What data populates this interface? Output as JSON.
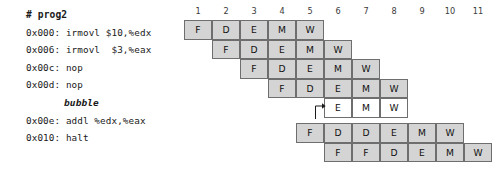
{
  "program": {
    "title": "# prog2",
    "lines": [
      {
        "text": "# prog2",
        "style": "title"
      },
      {
        "text": "0x000: irmovl $10,%edx",
        "style": "code"
      },
      {
        "text": "0x006: irmovl  $3,%eax",
        "style": "code"
      },
      {
        "text": "0x00c: nop",
        "style": "code"
      },
      {
        "text": "0x00d: nop",
        "style": "code"
      },
      {
        "text": "bubble",
        "style": "bubble"
      },
      {
        "text": "0x00e: addl %edx,%eax",
        "style": "code"
      },
      {
        "text": "0x010: halt",
        "style": "code"
      }
    ]
  },
  "chart_data": {
    "type": "table",
    "title": "# prog2",
    "xlabel": "cycle",
    "ylabel": "instruction",
    "cycles": [
      1,
      2,
      3,
      4,
      5,
      6,
      7,
      8,
      9,
      10,
      11
    ],
    "column_count": 11,
    "row_count": 7,
    "stage_names": {
      "F": "Fetch",
      "D": "Decode",
      "E": "Execute",
      "M": "Memory",
      "W": "Write back"
    },
    "colors": {
      "cell_fill": "#d4d4d4",
      "bubble_fill": "#ffffff",
      "cell_border": "#6e6e6e",
      "text": "#111111",
      "header_text": "#3a3a3a"
    },
    "rows": [
      {
        "instruction": "0x000: irmovl $10,%edx",
        "start_cycle": 1,
        "bubble": false,
        "stages": [
          "F",
          "D",
          "E",
          "M",
          "W"
        ]
      },
      {
        "instruction": "0x006: irmovl  $3,%eax",
        "start_cycle": 2,
        "bubble": false,
        "stages": [
          "F",
          "D",
          "E",
          "M",
          "W"
        ]
      },
      {
        "instruction": "0x00c: nop",
        "start_cycle": 3,
        "bubble": false,
        "stages": [
          "F",
          "D",
          "E",
          "M",
          "W"
        ]
      },
      {
        "instruction": "0x00d: nop",
        "start_cycle": 4,
        "bubble": false,
        "stages": [
          "F",
          "D",
          "E",
          "M",
          "W"
        ]
      },
      {
        "instruction": "bubble",
        "start_cycle": 6,
        "bubble": true,
        "stages": [
          "E",
          "M",
          "W"
        ]
      },
      {
        "instruction": "0x00e: addl %edx,%eax",
        "start_cycle": 5,
        "bubble": false,
        "stages": [
          "F",
          "D",
          "D",
          "E",
          "M",
          "W"
        ]
      },
      {
        "instruction": "0x010: halt",
        "start_cycle": 6,
        "bubble": false,
        "stages": [
          "F",
          "F",
          "D",
          "E",
          "M",
          "W"
        ]
      }
    ],
    "annotations": [
      {
        "name": "bubble-arrow",
        "from_row": 5,
        "from_cycle": 6,
        "to_row": 4,
        "to_cycle": 6,
        "description": "arrow from stalled decode stage into inserted bubble execute stage"
      }
    ],
    "grid": false,
    "legend": "none"
  }
}
